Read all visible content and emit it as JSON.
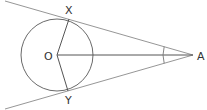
{
  "diagram": {
    "colors": {
      "line": "#555555",
      "tangent": "#8a8a8a",
      "label": "#333333",
      "background": "#ffffff"
    },
    "circle": {
      "center": {
        "x": 57,
        "y": 55
      },
      "radius": 36
    },
    "points": {
      "O": {
        "label": "O",
        "x": 57,
        "y": 55,
        "label_x": 44,
        "label_y": 60
      },
      "X": {
        "label": "X",
        "x": 69,
        "y": 19,
        "label_x": 65,
        "label_y": 14
      },
      "Y": {
        "label": "Y",
        "x": 68,
        "y": 91,
        "label_x": 65,
        "label_y": 104
      },
      "A": {
        "label": "A",
        "x": 193,
        "y": 55,
        "label_x": 197,
        "label_y": 60
      }
    },
    "segments": [
      {
        "name": "tangent-AX",
        "from": [
          5,
          1
        ],
        "to": [
          193,
          55
        ]
      },
      {
        "name": "tangent-AY",
        "from": [
          5,
          109
        ],
        "to": [
          193,
          55
        ]
      },
      {
        "name": "radius-OX",
        "from": [
          57,
          55
        ],
        "to": [
          69,
          19
        ]
      },
      {
        "name": "radius-OY",
        "from": [
          57,
          55
        ],
        "to": [
          68,
          91
        ]
      },
      {
        "name": "line-OA",
        "from": [
          57,
          55
        ],
        "to": [
          193,
          55
        ]
      }
    ],
    "angle_marker": {
      "vertex": "A",
      "radius": 30,
      "label": ""
    }
  }
}
